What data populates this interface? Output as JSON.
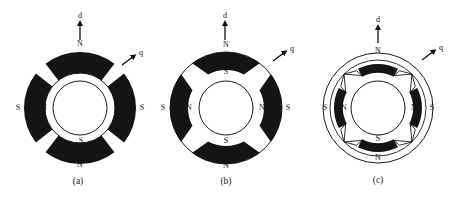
{
  "figure": {
    "panels": [
      {
        "id": "a",
        "caption": "(a)",
        "type": "surface-mounted",
        "d_axis_label": "d",
        "q_axis_label": "q",
        "outer_labels": {
          "top": "N",
          "right": "S",
          "bottom": "N",
          "left": "S"
        },
        "inner_labels": {
          "top": "S",
          "right": "N",
          "bottom": "S",
          "left": "N"
        }
      },
      {
        "id": "b",
        "caption": "(b)",
        "type": "inset",
        "d_axis_label": "d",
        "q_axis_label": "q",
        "outer_labels": {
          "top": "N",
          "right": "S",
          "bottom": "N",
          "left": "S"
        },
        "inner_labels": {
          "top": "S",
          "right": "N",
          "bottom": "S",
          "left": "N"
        }
      },
      {
        "id": "c",
        "caption": "(c)",
        "type": "interior",
        "d_axis_label": "d",
        "q_axis_label": "q",
        "outer_labels": {
          "top": "N",
          "right": "S",
          "bottom": "N",
          "left": "S"
        },
        "inner_labels": {
          "top": "S",
          "right": "N",
          "bottom": "S",
          "left": "N"
        }
      }
    ],
    "colors": {
      "magnet": "#141414",
      "line": "#1a1a1a",
      "background": "#ffffff"
    }
  }
}
